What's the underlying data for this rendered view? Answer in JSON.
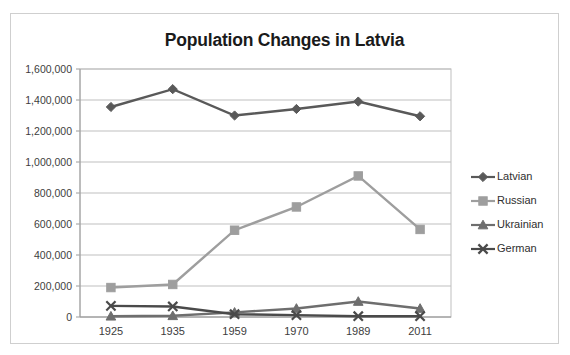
{
  "chart_data": {
    "type": "line",
    "title": "Population Changes in Latvia",
    "xlabel": "",
    "ylabel": "",
    "categories": [
      "1925",
      "1935",
      "1959",
      "1970",
      "1989",
      "2011"
    ],
    "ylim": [
      0,
      1600000
    ],
    "ytick_values": [
      0,
      200000,
      400000,
      600000,
      800000,
      1000000,
      1200000,
      1400000,
      1600000
    ],
    "ytick_labels": [
      "0",
      "200,000",
      "400,000",
      "600,000",
      "800,000",
      "1,000,000",
      "1,200,000",
      "1,400,000",
      "1,600,000"
    ],
    "grid": true,
    "legend_position": "right",
    "series": [
      {
        "name": "Latvian",
        "color": "#595959",
        "marker": "diamond",
        "values": [
          1355000,
          1470000,
          1300000,
          1342000,
          1390000,
          1295000
        ]
      },
      {
        "name": "Russian",
        "color": "#9e9e9e",
        "marker": "square",
        "values": [
          190000,
          210000,
          560000,
          710000,
          910000,
          565000
        ]
      },
      {
        "name": "Ukrainian",
        "color": "#6e6e6e",
        "marker": "triangle",
        "values": [
          5000,
          8000,
          30000,
          55000,
          100000,
          55000
        ]
      },
      {
        "name": "German",
        "color": "#4a4a4a",
        "marker": "x",
        "values": [
          72000,
          68000,
          18000,
          12000,
          5000,
          5000
        ]
      }
    ]
  },
  "legend": {
    "items": [
      {
        "label": "Latvian"
      },
      {
        "label": "Russian"
      },
      {
        "label": "Ukrainian"
      },
      {
        "label": "German"
      }
    ]
  }
}
